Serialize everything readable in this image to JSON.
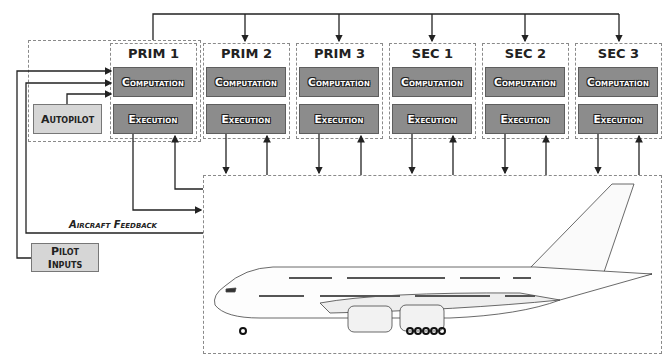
{
  "diagram": {
    "type": "flight-control-architecture",
    "computers": [
      {
        "id": "prim1",
        "title": "PRIM 1",
        "computation": "Computation",
        "execution": "Execution"
      },
      {
        "id": "prim2",
        "title": "PRIM 2",
        "computation": "Computation",
        "execution": "Execution"
      },
      {
        "id": "prim3",
        "title": "PRIM 3",
        "computation": "Computation",
        "execution": "Execution"
      },
      {
        "id": "sec1",
        "title": "SEC 1",
        "computation": "Computation",
        "execution": "Execution"
      },
      {
        "id": "sec2",
        "title": "SEC 2",
        "computation": "Computation",
        "execution": "Execution"
      },
      {
        "id": "sec3",
        "title": "SEC 3",
        "computation": "Computation",
        "execution": "Execution"
      }
    ],
    "autopilot": "Autopilot",
    "pilot_inputs": "Pilot Inputs",
    "feedback_label": "Aircraft Feedback",
    "aircraft": "aircraft-side-view",
    "colors": {
      "module_fill": "#8c8c8c",
      "input_fill": "#d6d6d6",
      "dash": "#8a8a8a",
      "line": "#222222"
    }
  }
}
